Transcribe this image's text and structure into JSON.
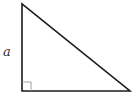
{
  "diagram": {
    "type": "right-triangle",
    "colors": {
      "stroke": "#1a1a1a",
      "marker": "#9a9a9a",
      "label": "#333333",
      "background": "#ffffff"
    },
    "vertices": {
      "top": [
        22,
        4
      ],
      "bottom_left": [
        22,
        91
      ],
      "bottom_right": [
        130,
        91
      ]
    },
    "right_angle_marker": {
      "corner": "bottom-left",
      "size": 9
    },
    "labels": {
      "vertical_side": "a"
    }
  }
}
